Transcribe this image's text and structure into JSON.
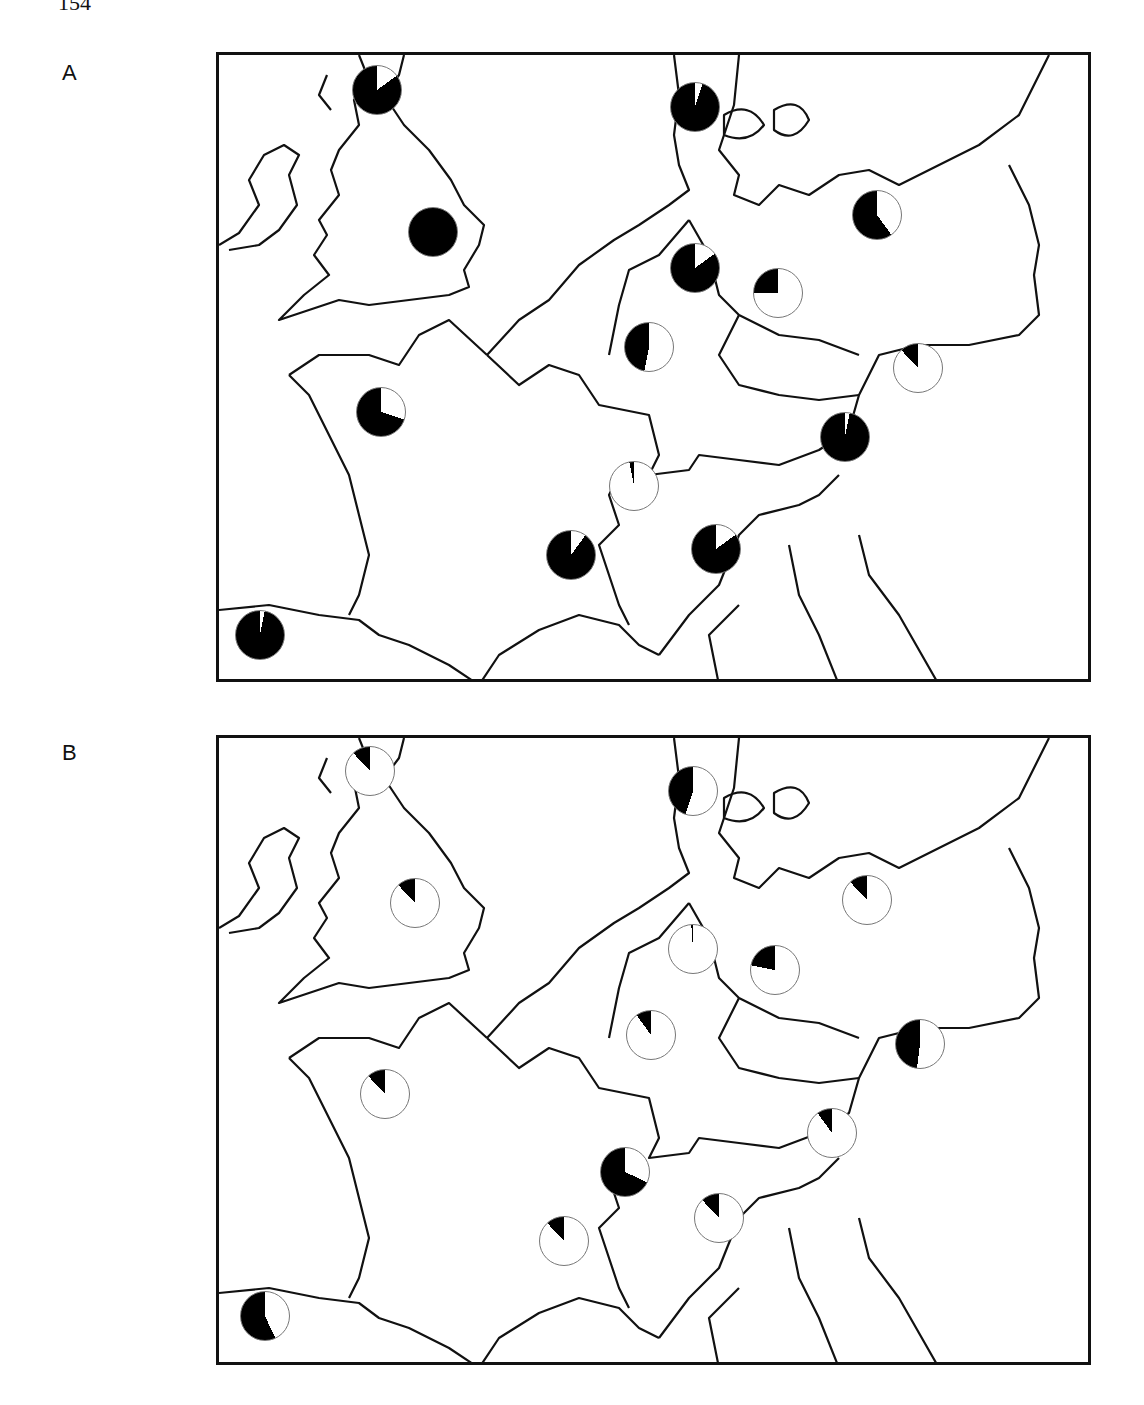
{
  "page": {
    "number": "154"
  },
  "chart_data": [
    {
      "type": "pie-map",
      "title": "A",
      "description": "Map of western/central Europe with pie charts; black sector = proportion",
      "pie_color_filled": "#000000",
      "pie_color_empty": "#ffffff",
      "pies": [
        {
          "region": "Scotland",
          "x": 377,
          "y": 90,
          "fraction_black": 0.85
        },
        {
          "region": "Denmark (Jutland)",
          "x": 695,
          "y": 107,
          "fraction_black": 0.95
        },
        {
          "region": "England",
          "x": 433,
          "y": 232,
          "fraction_black": 1.0
        },
        {
          "region": "Poland (north)",
          "x": 877,
          "y": 215,
          "fraction_black": 0.6
        },
        {
          "region": "Germany (north)",
          "x": 695,
          "y": 268,
          "fraction_black": 0.85
        },
        {
          "region": "East Germany",
          "x": 778,
          "y": 293,
          "fraction_black": 0.25
        },
        {
          "region": "Germany (central)",
          "x": 649,
          "y": 347,
          "fraction_black": 0.47
        },
        {
          "region": "Czechoslovakia",
          "x": 918,
          "y": 368,
          "fraction_black": 0.12
        },
        {
          "region": "France (Brittany)",
          "x": 381,
          "y": 412,
          "fraction_black": 0.7
        },
        {
          "region": "Austria",
          "x": 845,
          "y": 437,
          "fraction_black": 0.97
        },
        {
          "region": "Switzerland",
          "x": 634,
          "y": 486,
          "fraction_black": 0.03
        },
        {
          "region": "France (south)",
          "x": 571,
          "y": 555,
          "fraction_black": 0.9
        },
        {
          "region": "Italy (north)",
          "x": 716,
          "y": 549,
          "fraction_black": 0.85
        },
        {
          "region": "Spain (north)",
          "x": 260,
          "y": 635,
          "fraction_black": 0.97
        }
      ]
    },
    {
      "type": "pie-map",
      "title": "B",
      "description": "Map of western/central Europe with pie charts; black sector = proportion",
      "pie_color_filled": "#000000",
      "pie_color_empty": "#ffffff",
      "pies": [
        {
          "region": "Scotland",
          "x": 370,
          "y": 771,
          "fraction_black": 0.12
        },
        {
          "region": "Denmark (Jutland)",
          "x": 693,
          "y": 791,
          "fraction_black": 0.45
        },
        {
          "region": "England",
          "x": 415,
          "y": 903,
          "fraction_black": 0.12
        },
        {
          "region": "Poland (north)",
          "x": 867,
          "y": 900,
          "fraction_black": 0.12
        },
        {
          "region": "Germany (north)",
          "x": 693,
          "y": 949,
          "fraction_black": 0.01
        },
        {
          "region": "East Germany",
          "x": 775,
          "y": 970,
          "fraction_black": 0.22
        },
        {
          "region": "Germany (central)",
          "x": 651,
          "y": 1035,
          "fraction_black": 0.1
        },
        {
          "region": "Czechoslovakia",
          "x": 920,
          "y": 1044,
          "fraction_black": 0.48
        },
        {
          "region": "France (Brittany)",
          "x": 385,
          "y": 1094,
          "fraction_black": 0.12
        },
        {
          "region": "Austria",
          "x": 832,
          "y": 1133,
          "fraction_black": 0.1
        },
        {
          "region": "Switzerland",
          "x": 625,
          "y": 1172,
          "fraction_black": 0.68
        },
        {
          "region": "France (south)",
          "x": 564,
          "y": 1241,
          "fraction_black": 0.12
        },
        {
          "region": "Italy (north)",
          "x": 719,
          "y": 1218,
          "fraction_black": 0.12
        },
        {
          "region": "Spain (north)",
          "x": 265,
          "y": 1316,
          "fraction_black": 0.57
        }
      ]
    }
  ],
  "panels": [
    {
      "label": "A"
    },
    {
      "label": "B"
    }
  ]
}
